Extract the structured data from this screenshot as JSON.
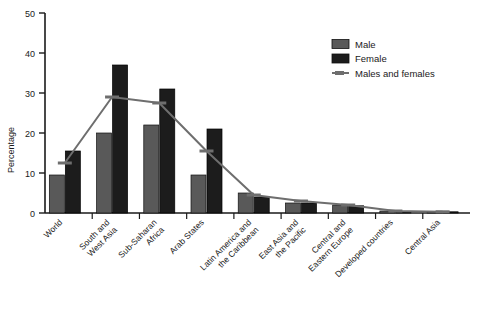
{
  "chart_data": {
    "type": "bar",
    "title": "",
    "xlabel": "",
    "ylabel": "Percentage",
    "ylim": [
      0,
      50
    ],
    "yticks": [
      0,
      10,
      20,
      30,
      40,
      50
    ],
    "ytick_labels": [
      "0",
      "10",
      "20",
      "30",
      "40",
      "50"
    ],
    "grid": false,
    "legend_position": "top-right",
    "categories": [
      "World",
      "South and West Asia",
      "Sub-Saharan Africa",
      "Arab States",
      "Latin America and the Caribbean",
      "East Asia and the Pacific",
      "Central and Eastern Europe",
      "Developed countries",
      "Central Asia"
    ],
    "category_lines": [
      [
        "World"
      ],
      [
        "South and",
        "West Asia"
      ],
      [
        "Sub-Saharan",
        "Africa"
      ],
      [
        "Arab States"
      ],
      [
        "Latin America and",
        "the Caribbean"
      ],
      [
        "East Asia and",
        "the Pacific"
      ],
      [
        "Central and",
        "Eastern Europe"
      ],
      [
        "Developed countries"
      ],
      [
        "Central Asia"
      ]
    ],
    "series": [
      {
        "name": "Male",
        "type": "bar",
        "color": "#595959",
        "values": [
          9.5,
          20.0,
          22.0,
          9.5,
          5.0,
          2.5,
          2.0,
          0.5,
          0.3
        ]
      },
      {
        "name": "Female",
        "type": "bar",
        "color": "#1c1c1c",
        "values": [
          15.5,
          37.0,
          31.0,
          21.0,
          4.0,
          2.5,
          1.8,
          0.4,
          0.3
        ]
      },
      {
        "name": "Males and females",
        "type": "line",
        "color": "#6e6e6e",
        "values": [
          12.5,
          29.0,
          27.5,
          15.5,
          4.5,
          3.0,
          2.0,
          0.5,
          0.3
        ]
      }
    ]
  },
  "legend": {
    "items": [
      {
        "label": "Male",
        "marker": "swatch",
        "color": "#595959"
      },
      {
        "label": "Female",
        "marker": "swatch",
        "color": "#1c1c1c"
      },
      {
        "label": "Males and females",
        "marker": "line",
        "color": "#6e6e6e"
      }
    ]
  },
  "axis": {
    "y_title": "Percentage"
  }
}
